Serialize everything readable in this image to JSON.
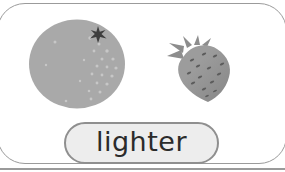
{
  "card": {
    "word": "lighter",
    "images": [
      {
        "name": "orange-image"
      },
      {
        "name": "strawberry-image"
      }
    ]
  },
  "colors": {
    "card_border": "#9b9b9b",
    "divider": "#9a9a9a",
    "pill_fill": "#ededed",
    "pill_border": "#8f8f8f",
    "word_text": "#2b2b2b",
    "orange_fill": "#a9a9a9",
    "orange_speckle": "#c7c7c7",
    "orange_star": "#3e3e3e",
    "strawberry_fill": "#9c9c9c",
    "strawberry_dark": "#868686",
    "strawberry_leaf": "#8d8d8d",
    "strawberry_seed": "#5c5c5c"
  }
}
